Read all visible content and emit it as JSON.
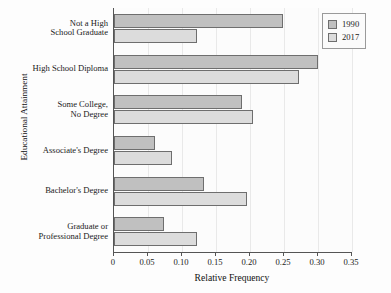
{
  "chart_data": {
    "type": "bar",
    "orientation": "horizontal",
    "title": "",
    "xlabel": "Relative Frequency",
    "ylabel": "Educational Attainment",
    "xlim": [
      0,
      0.35
    ],
    "xticks": [
      "0",
      "0.05",
      "0.10",
      "0.15",
      "0.20",
      "0.25",
      "0.30",
      "0.35"
    ],
    "xtick_values": [
      0,
      0.05,
      0.1,
      0.15,
      0.2,
      0.25,
      0.3,
      0.35
    ],
    "grid": "vertical-only",
    "legend_position": "top-right",
    "categories": [
      "Not a High\nSchool Graduate",
      "High School Diploma",
      "Some College,\nNo Degree",
      "Associate's Degree",
      "Bachelor's Degree",
      "Graduate or\nProfessional Degree"
    ],
    "series": [
      {
        "name": "1990",
        "color": "#c0c0c0",
        "values": [
          0.248,
          0.3,
          0.188,
          0.06,
          0.132,
          0.073
        ]
      },
      {
        "name": "2017",
        "color": "#dcdcdc",
        "values": [
          0.122,
          0.272,
          0.205,
          0.085,
          0.196,
          0.122
        ]
      }
    ]
  },
  "legend": {
    "entries": [
      {
        "label": "1990"
      },
      {
        "label": "2017"
      }
    ]
  },
  "colors": {
    "series_1990": "#c0c0c0",
    "series_2017": "#dcdcdc",
    "axis": "#555555",
    "grid": "#e9e9e9",
    "text": "#1a1a1a",
    "background": "#fdfdfd"
  }
}
